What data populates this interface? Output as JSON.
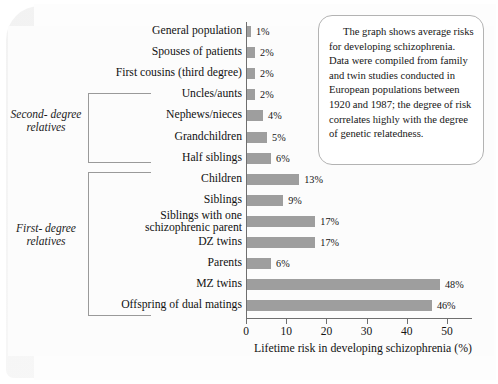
{
  "figure": {
    "caption_text": "The graph shows average risks for developing schizophrenia. Data were compiled from family and twin studies conducted in European populations between 1920 and 1987; the degree of risk correlates highly with the degree of genetic relatedness.",
    "group_labels": {
      "second_degree": "Second-\ndegree\nrelatives",
      "first_degree": "First-\ndegree\nrelatives"
    },
    "colors": {
      "bar": "#9e9e9e",
      "axis": "#6f6f6f",
      "text": "#121212",
      "caption_border": "#b3b3b3",
      "bracket": "#9a9a9a"
    }
  },
  "chart_data": {
    "type": "bar",
    "orientation": "horizontal",
    "title": "",
    "xlabel": "Lifetime risk in developing schizophrenia (%)",
    "ylabel": "",
    "xlim": [
      0,
      56
    ],
    "xticks": [
      0,
      10,
      20,
      30,
      40,
      50
    ],
    "xtick_labels": [
      "0",
      "10",
      "20",
      "30",
      "40",
      "50"
    ],
    "grid": false,
    "legend": false,
    "value_suffix": "%",
    "categories": [
      "General population",
      "Spouses of patients",
      "First cousins (third degree)",
      "Uncles/aunts",
      "Nephews/nieces",
      "Grandchildren",
      "Half siblings",
      "Children",
      "Siblings",
      "Siblings with one\nschizophrenic parent",
      "DZ twins",
      "Parents",
      "MZ twins",
      "Offspring of dual matings"
    ],
    "values": [
      1,
      2,
      2,
      2,
      4,
      5,
      6,
      13,
      9,
      17,
      17,
      6,
      48,
      46
    ],
    "value_labels": [
      "1%",
      "2%",
      "2%",
      "2%",
      "4%",
      "5%",
      "6%",
      "13%",
      "9%",
      "17%",
      "17%",
      "6%",
      "48%",
      "46%"
    ],
    "groups": [
      {
        "name": "Second-degree relatives",
        "from_index": 3,
        "to_index": 6
      },
      {
        "name": "First-degree relatives",
        "from_index": 7,
        "to_index": 13
      }
    ]
  }
}
